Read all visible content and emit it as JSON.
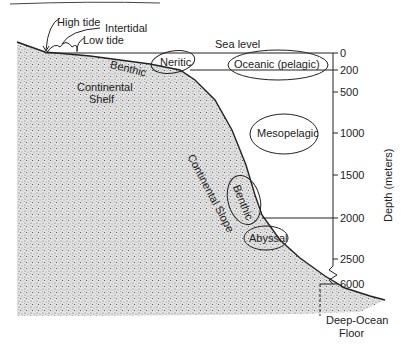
{
  "diagram": {
    "labels": {
      "high_tide": "High tide",
      "intertidal": "Intertidal",
      "low_tide": "Low tide",
      "sea_level": "Sea level",
      "neritic": "Neritic",
      "oceanic": "Oceanic (pelagic)",
      "benthic_shelf": "Benthic",
      "continental_shelf_1": "Continental",
      "continental_shelf_2": "Shelf",
      "mesopelagic": "Mesopelagic",
      "continental_slope": "Continental Slope",
      "benthic_slope": "Benthic",
      "abyssal": "Abyssal",
      "deep_ocean_1": "Deep-Ocean",
      "deep_ocean_2": "Floor"
    },
    "axis": {
      "title": "Depth (meters)",
      "ticks": [
        "0",
        "200",
        "500",
        "1000",
        "1500",
        "2000",
        "2500",
        "6000"
      ]
    },
    "colors": {
      "ink": "#222222",
      "stipple": "#6a6a6a",
      "background": "#ffffff"
    }
  }
}
